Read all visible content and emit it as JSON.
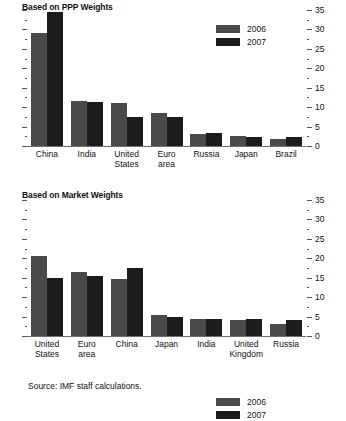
{
  "figure": {
    "source_note": "Source: IMF staff calculations."
  },
  "chart_data": [
    {
      "type": "bar",
      "title": "Based on PPP Weights",
      "xlabel": "",
      "ylabel": "",
      "ylim": [
        0,
        35
      ],
      "ytick_step": 5,
      "yminor_step": 2.5,
      "grid": false,
      "legend_position": "top-right",
      "axis_side": "both",
      "tick_labels": [
        "0",
        "5",
        "10",
        "15",
        "20",
        "25",
        "30",
        "35"
      ],
      "categories": [
        "China",
        "India",
        "United States",
        "Euro area",
        "Russia",
        "Japan",
        "Brazil"
      ],
      "category_lines": [
        [
          "China"
        ],
        [
          "India"
        ],
        [
          "United",
          "States"
        ],
        [
          "Euro",
          "area"
        ],
        [
          "Russia"
        ],
        [
          "Japan"
        ],
        [
          "Brazil"
        ]
      ],
      "series": [
        {
          "name": "2006",
          "color": "#4a4a4a",
          "values": [
            29.0,
            11.5,
            11.0,
            8.5,
            3.0,
            2.5,
            1.8
          ]
        },
        {
          "name": "2007",
          "color": "#1c1c1c",
          "values": [
            34.5,
            11.2,
            7.5,
            7.4,
            3.4,
            2.3,
            2.2
          ]
        }
      ]
    },
    {
      "type": "bar",
      "title": "Based on Market Weights",
      "xlabel": "",
      "ylabel": "",
      "ylim": [
        0,
        35
      ],
      "ytick_step": 5,
      "yminor_step": 2.5,
      "grid": false,
      "legend_position": "top-right",
      "axis_side": "both",
      "tick_labels": [
        "0",
        "5",
        "10",
        "15",
        "20",
        "25",
        "30",
        "35"
      ],
      "categories": [
        "United States",
        "Euro area",
        "China",
        "Japan",
        "India",
        "United Kingdom",
        "Russia"
      ],
      "category_lines": [
        [
          "United",
          "States"
        ],
        [
          "Euro",
          "area"
        ],
        [
          "China"
        ],
        [
          "Japan"
        ],
        [
          "India"
        ],
        [
          "United",
          "Kingdom"
        ],
        [
          "Russia"
        ]
      ],
      "series": [
        {
          "name": "2006",
          "color": "#4a4a4a",
          "values": [
            20.5,
            16.5,
            14.8,
            5.5,
            4.5,
            4.0,
            3.0
          ]
        },
        {
          "name": "2007",
          "color": "#1c1c1c",
          "values": [
            15.0,
            15.5,
            17.5,
            4.8,
            4.5,
            4.3,
            4.0
          ]
        }
      ]
    }
  ]
}
